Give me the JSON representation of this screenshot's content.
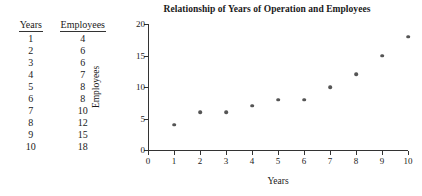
{
  "table": {
    "headers": [
      "Years",
      "Employees"
    ],
    "rows": [
      [
        "1",
        "4"
      ],
      [
        "2",
        "6"
      ],
      [
        "3",
        "6"
      ],
      [
        "4",
        "7"
      ],
      [
        "5",
        "8"
      ],
      [
        "6",
        "8"
      ],
      [
        "7",
        "10"
      ],
      [
        "8",
        "12"
      ],
      [
        "9",
        "15"
      ],
      [
        "10",
        "18"
      ]
    ]
  },
  "chart_data": {
    "type": "scatter",
    "title": "Relationship of Years of Operation and Employees",
    "xlabel": "Years",
    "ylabel": "Employees",
    "x": [
      1,
      2,
      3,
      4,
      5,
      6,
      7,
      8,
      9,
      10
    ],
    "values": [
      4,
      6,
      6,
      7,
      8,
      8,
      10,
      12,
      15,
      18
    ],
    "series": [
      {
        "name": "Employees",
        "values": [
          4,
          6,
          6,
          7,
          8,
          8,
          10,
          12,
          15,
          18
        ]
      }
    ],
    "xlim": [
      0,
      10
    ],
    "ylim": [
      0,
      20
    ],
    "xticks": [
      "0",
      "1",
      "2",
      "3",
      "4",
      "5",
      "6",
      "7",
      "8",
      "9",
      "10"
    ],
    "yticks": [
      "0",
      "5",
      "10",
      "15",
      "20"
    ],
    "grid": false,
    "legend": false,
    "marker_color": "#555555",
    "axis_color": "#333333"
  }
}
